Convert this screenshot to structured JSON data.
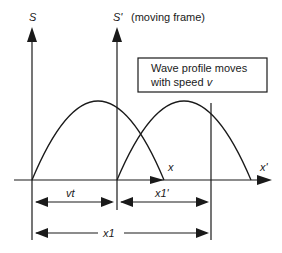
{
  "diagram": {
    "frames": {
      "stationary": {
        "label": "S"
      },
      "moving": {
        "label": "S'",
        "note": "(moving frame)"
      }
    },
    "axes": {
      "x": "x",
      "x_prime": "x'"
    },
    "callout": {
      "line1": "Wave profile moves",
      "line2_prefix": "with speed ",
      "line2_var": "v"
    },
    "dimensions": {
      "vt": "vt",
      "x1_prime": "x1'",
      "x1": "x1"
    },
    "colors": {
      "ink": "#1a1a1a",
      "background": "#ffffff"
    }
  }
}
